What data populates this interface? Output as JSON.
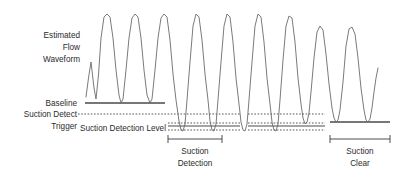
{
  "diagram": {
    "background_color": "#ffffff",
    "wave_color": "#6b6b6b",
    "line_color": "#4a4a4a",
    "text_color": "#2b2b2b"
  },
  "labels": {
    "waveform_line1": "Estimated",
    "waveform_line2": "Flow",
    "waveform_line3": "Waveform",
    "baseline": "Baseline",
    "trigger_line1": "Suction Detect",
    "trigger_line2": "Trigger",
    "detection_level": "Suction Detection Level",
    "suction_detection_line1": "Suction",
    "suction_detection_line2": "Detection",
    "suction_clear_line1": "Suction",
    "suction_clear_line2": "Clear"
  },
  "chart_data": {
    "type": "line",
    "title": "Estimated Flow Waveform",
    "xlabel": "",
    "ylabel": "Flow",
    "grid": false,
    "legend": "none",
    "reference_levels": [
      {
        "name": "Baseline",
        "y_px": 103,
        "style": "solid",
        "segments": [
          [
            85,
            165
          ],
          [
            330,
            390
          ]
        ]
      },
      {
        "name": "Suction Detect Trigger",
        "y_px": 114,
        "style": "dotted",
        "segments": [
          [
            78,
            240
          ],
          [
            248,
            325
          ]
        ]
      },
      {
        "name": "Suction Detection Level",
        "y_px": 128,
        "style": "dotted",
        "segments": [
          [
            168,
            240
          ],
          [
            248,
            325
          ]
        ]
      },
      {
        "name": "Suction Detection Level Solid",
        "y_px": 125,
        "style": "solid",
        "segments": [
          [
            168,
            240
          ],
          [
            248,
            325
          ]
        ]
      },
      {
        "name": "Suction Detection Level Lower",
        "y_px": 131,
        "style": "dotted",
        "segments": [
          [
            168,
            240
          ],
          [
            248,
            325
          ]
        ]
      }
    ],
    "regions": [
      {
        "name": "Suction Detection",
        "x_start": 168,
        "x_end": 222,
        "label_y_px": 152
      },
      {
        "name": "Suction Clear",
        "x_start": 330,
        "x_end": 390,
        "label_y_px": 152
      }
    ],
    "cycles": [
      {
        "index": 1,
        "peak_x": 102,
        "peak_y": 14,
        "trough_y": 103,
        "type": "normal"
      },
      {
        "index": 2,
        "peak_x": 134,
        "peak_y": 14,
        "trough_y": 103,
        "type": "normal"
      },
      {
        "index": 3,
        "peak_x": 164,
        "peak_y": 14,
        "trough_y": 103,
        "type": "normal"
      },
      {
        "index": 4,
        "peak_x": 192,
        "peak_y": 14,
        "trough_y": 131,
        "type": "suction"
      },
      {
        "index": 5,
        "peak_x": 221,
        "peak_y": 14,
        "trough_y": 131,
        "type": "suction"
      },
      {
        "index": 6,
        "peak_x": 252,
        "peak_y": 14,
        "trough_y": 131,
        "type": "suction"
      },
      {
        "index": 7,
        "peak_x": 282,
        "peak_y": 18,
        "trough_y": 131,
        "type": "suction"
      },
      {
        "index": 8,
        "peak_x": 312,
        "peak_y": 26,
        "trough_y": 122,
        "type": "clear"
      },
      {
        "index": 9,
        "peak_x": 344,
        "peak_y": 27,
        "trough_y": 122,
        "type": "clear"
      }
    ]
  },
  "geometry": {
    "wave_path": "M 86 97 L 88.5 78 L 91 62 L 94 88 L 96 99 L 98.5 75 L 101 38 L 104 17 L 107 14 L 110 17 L 113 38 L 116 70 L 119 95 L 121 103 L 123 99 L 126 70 L 129 38 L 132 18 L 135 14 L 138 17 L 141 38 L 144 70 L 147 95 L 150 103 L 152 99 L 155 70 L 158 38 L 161 18 L 164 14 L 167 17 L 170 40 L 173 74 L 176 100 L 179 121 L 181 130 L 183 131 L 185 124 L 187 100 L 190 62 L 193 26 L 196 14 L 199 17 L 202 40 L 205 74 L 208 100 L 210 121 L 212 130 L 214 131 L 216 124 L 218 100 L 221 62 L 224 26 L 227 14 L 230 17 L 233 42 L 236 78 L 239 104 L 241 122 L 243 130 L 245 131 L 247 124 L 249 100 L 252 62 L 255 26 L 258 14 L 261 17 L 264 42 L 267 78 L 270 104 L 272 122 L 274 130 L 276 131 L 278 124 L 280 100 L 283 60 L 286 26 L 289 16 L 292 18 L 295 42 L 298 78 L 301 104 L 303 118 L 305 124 L 307 122 L 309 113 L 311 92 L 314 58 L 317 32 L 320 26 L 323 30 L 326 54 L 329 84 L 332 108 L 334 118 L 336 122 L 338 120 L 340 110 L 343 82 L 346 46 L 349 29 L 352 27 L 355 34 L 358 58 L 361 88 L 364 110 L 366 120 L 368 122 L 370 119 L 372 108 L 374 92 L 376 78 L 378 68",
    "label_positions": {
      "waveform_x": 80,
      "waveform_y1": 36,
      "waveform_y2": 48,
      "waveform_y3": 60,
      "baseline_x": 80,
      "baseline_y": 106,
      "trigger_y1": 117,
      "trigger_y2": 129,
      "detection_level_x": 166,
      "detection_level_y": 131,
      "region1_label_x": 195,
      "region2_label_x": 360,
      "region_label_y1": 153,
      "region_label_y2": 165
    }
  }
}
